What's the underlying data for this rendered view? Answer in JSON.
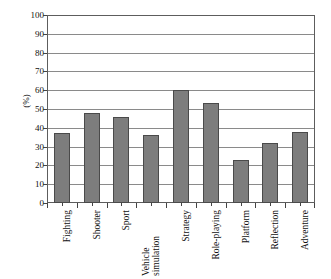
{
  "chart_data": {
    "type": "bar",
    "title": "",
    "subtitle": "",
    "xlabel": "",
    "ylabel": "(%)",
    "ylim": [
      0,
      100
    ],
    "ytick_step": 10,
    "yticks": [
      100,
      90,
      80,
      70,
      60,
      50,
      40,
      30,
      20,
      10,
      0
    ],
    "grid": true,
    "grid_axis": "y",
    "legend": false,
    "legend_position": "none",
    "bar_color": "#7d7d7d",
    "bar_edge_color": "#4a4a4a",
    "axis_color": "#5d5d5d",
    "background_color": "#ffffff",
    "xtick_label_rotation": 90,
    "categories": [
      "Fighting",
      "Shooter",
      "Sport",
      "Vehicle simulation",
      "Strategy",
      "Role-playing",
      "Platform",
      "Reflection",
      "Adventure"
    ],
    "category_lines": [
      [
        "Fighting"
      ],
      [
        "Shooter"
      ],
      [
        "Sport"
      ],
      [
        "Vehicle",
        "simulation"
      ],
      [
        "Strategy"
      ],
      [
        "Role-playing"
      ],
      [
        "Platform"
      ],
      [
        "Reflection"
      ],
      [
        "Adventure"
      ]
    ],
    "values": [
      37,
      48,
      46,
      36,
      60,
      53,
      23,
      32,
      38
    ]
  }
}
